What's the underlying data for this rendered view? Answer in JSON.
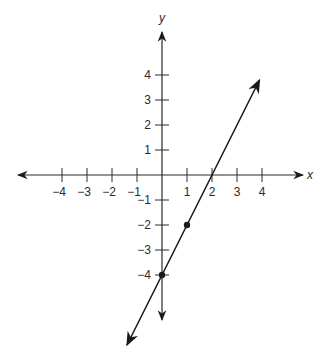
{
  "chart_data": {
    "type": "line",
    "title": "",
    "xlabel": "x",
    "ylabel": "y",
    "xlim": [
      -5.8,
      5.6
    ],
    "ylim": [
      -5.7,
      5.7
    ],
    "grid": false,
    "legend": null,
    "x_ticks": [
      -4,
      -3,
      -2,
      -1,
      1,
      2,
      3,
      4
    ],
    "x_tick_labels": [
      "−4",
      "−3",
      "−2",
      "−1",
      "1",
      "2",
      "3",
      "4"
    ],
    "y_ticks": [
      4,
      3,
      2,
      1,
      -1,
      -2,
      -3,
      -4
    ],
    "y_tick_labels": [
      "4",
      "3",
      "2",
      "1",
      "−1",
      "−2",
      "−3",
      "−4"
    ],
    "series": [
      {
        "name": "line",
        "equation": "y = 2x - 4",
        "slope": 2,
        "intercept": -4,
        "x": [
          -1.4,
          3.9
        ],
        "y": [
          -6.8,
          3.8
        ],
        "arrows_both_ends": true
      }
    ],
    "points": [
      {
        "x": 0,
        "y": -4
      },
      {
        "x": 1,
        "y": -2
      }
    ],
    "colors": {
      "axis": "#2a2a2a",
      "line": "#1a1a1a",
      "text": "#2a2a2a"
    }
  },
  "layout": {
    "origin_px": [
      162,
      175
    ],
    "unit_px": 25
  }
}
